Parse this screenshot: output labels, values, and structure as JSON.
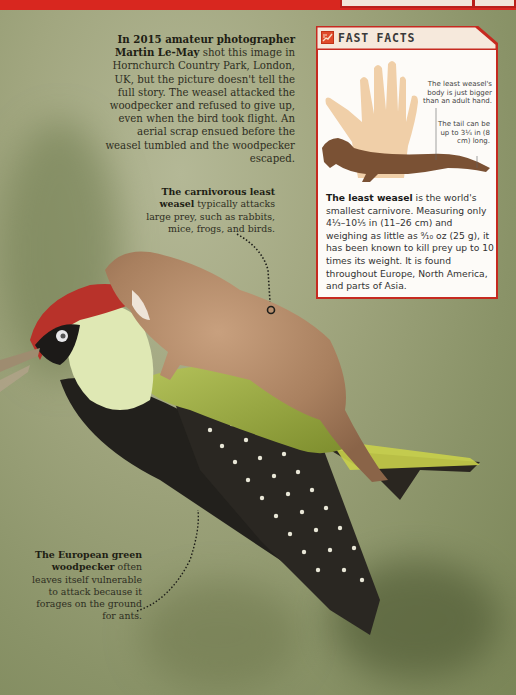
{
  "header": {
    "strip_color": "#d8271f",
    "tab_text": "SMALLEST FACT"
  },
  "intro": {
    "lead_bold": "In 2015 amateur photographer Martin Le-May",
    "body": " shot this image in Hornchurch Country Park, London, UK, but the picture doesn't tell the full story. The weasel attacked the woodpecker and refused to give up, even when the bird took flight. An aerial scrap ensued before the weasel tumbled and the woodpecker escaped."
  },
  "callouts": {
    "weasel": {
      "bold": "The carnivorous least weasel",
      "text": " typically attacks large prey, such as rabbits, mice, frogs, and birds."
    },
    "woodpecker": {
      "bold": "The European green woodpecker",
      "text": " often leaves itself vulnerable to attack because it forages on the ground for ants."
    }
  },
  "fast_facts": {
    "title": "FAST FACTS",
    "icon": "fast-facts-icon",
    "accent_color": "#c62a20",
    "illustration": {
      "note_body": "The least weasel's body is just bigger than an adult hand.",
      "note_tail": "The tail can be up to 3¼ in (8 cm) long."
    },
    "text_bold": "The least weasel",
    "text_body": " is the world's smallest carnivore. Measuring only 4⅓–10⅕ in (11–26 cm) and weighing as little as ⁹⁄₁₀ oz (25 g), it has been known to kill prey up to 10 times its weight. It is found throughout Europe, North America, and parts of Asia."
  }
}
